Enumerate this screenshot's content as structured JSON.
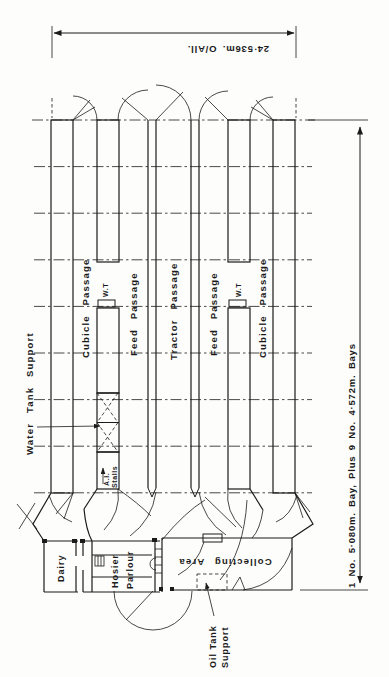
{
  "dims": {
    "overall": "24·536m. O/All.",
    "bays": "1 No. 5·080m. Bay, Plus  9 No. 4·572m. Bays"
  },
  "passages": {
    "cubicle_left": "Cubicle Passage",
    "feed_left": "Feed Passage",
    "tractor": "Tractor Passage",
    "feed_right": "Feed Passage",
    "cubicle_right": "Cubicle Passage"
  },
  "marks": {
    "water_tank": "Water Tank Support",
    "wt_left": "W.T",
    "wt_right": "W.T",
    "ai_1": "A.I.",
    "ai_2": "Stalls",
    "oil_1": "Oil Tank",
    "oil_2": "Support"
  },
  "rooms": {
    "dairy": "Dairy",
    "parlour_1": "Hosier",
    "parlour_2": "Parlour",
    "collecting": "Collecting  Area"
  },
  "colors": {
    "ink": "#1b1b1b",
    "paper": "#fdfdfc"
  }
}
